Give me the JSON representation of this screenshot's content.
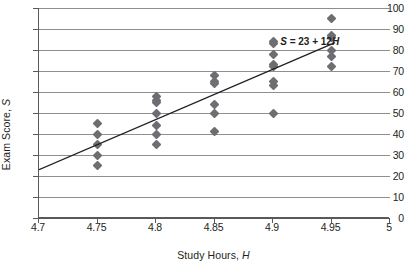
{
  "chart_data": {
    "type": "scatter",
    "title": "",
    "xlabel_parts": {
      "text": "Study Hours, ",
      "symbol": "H"
    },
    "ylabel_parts": {
      "text": "Exam Score, ",
      "symbol": "S"
    },
    "xlabel": "Study Hours, H",
    "ylabel": "Exam Score, S",
    "xlim": [
      4.7,
      5.0
    ],
    "ylim": [
      0,
      100
    ],
    "xticks": [
      "4.7",
      "4.75",
      "4.8",
      "4.85",
      "4.9",
      "4.95",
      "5"
    ],
    "xtick_values": [
      4.7,
      4.75,
      4.8,
      4.85,
      4.9,
      4.95,
      5.0
    ],
    "yticks": [
      "0",
      "10",
      "20",
      "30",
      "40",
      "50",
      "60",
      "70",
      "80",
      "90",
      "100"
    ],
    "ytick_values": [
      0,
      10,
      20,
      30,
      40,
      50,
      60,
      70,
      80,
      90,
      100
    ],
    "grid": "horizontal",
    "legend": "none",
    "marker_shape": "diamond",
    "marker_color": "#6d6e71",
    "gridline_color": "#8d8f91",
    "axis_color": "#58595b",
    "trendline_color": "#231f20",
    "points": [
      {
        "x": 4.75,
        "y": 45
      },
      {
        "x": 4.75,
        "y": 40
      },
      {
        "x": 4.75,
        "y": 35
      },
      {
        "x": 4.75,
        "y": 30
      },
      {
        "x": 4.75,
        "y": 25
      },
      {
        "x": 4.8,
        "y": 58
      },
      {
        "x": 4.8,
        "y": 56
      },
      {
        "x": 4.8,
        "y": 55
      },
      {
        "x": 4.8,
        "y": 50
      },
      {
        "x": 4.8,
        "y": 44
      },
      {
        "x": 4.8,
        "y": 40
      },
      {
        "x": 4.8,
        "y": 35
      },
      {
        "x": 4.85,
        "y": 68
      },
      {
        "x": 4.85,
        "y": 65
      },
      {
        "x": 4.85,
        "y": 64
      },
      {
        "x": 4.85,
        "y": 54
      },
      {
        "x": 4.85,
        "y": 50
      },
      {
        "x": 4.85,
        "y": 41
      },
      {
        "x": 4.9,
        "y": 84
      },
      {
        "x": 4.9,
        "y": 83
      },
      {
        "x": 4.9,
        "y": 78
      },
      {
        "x": 4.9,
        "y": 73
      },
      {
        "x": 4.9,
        "y": 72
      },
      {
        "x": 4.9,
        "y": 65
      },
      {
        "x": 4.9,
        "y": 63
      },
      {
        "x": 4.9,
        "y": 50
      },
      {
        "x": 4.95,
        "y": 95
      },
      {
        "x": 4.95,
        "y": 87
      },
      {
        "x": 4.95,
        "y": 86
      },
      {
        "x": 4.95,
        "y": 80
      },
      {
        "x": 4.95,
        "y": 77
      },
      {
        "x": 4.95,
        "y": 72
      }
    ],
    "trendline": {
      "equation_text": "S = 23 + 12H",
      "equation_prefix": "S",
      "equation_body": " = 23 + 12",
      "equation_suffix": "H",
      "intercept_label": 23,
      "slope_label": 12,
      "x_start": 4.7,
      "y_start": 23,
      "x_end": 4.953,
      "y_end": 83.5
    },
    "annotations": [
      {
        "name": "trendline-equation",
        "text": "S = 23 + 12H",
        "x": 4.907,
        "y": 84
      }
    ]
  }
}
